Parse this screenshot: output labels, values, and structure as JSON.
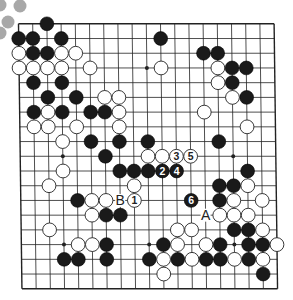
{
  "diagram": {
    "type": "go-board",
    "size": 19,
    "colors": {
      "background": "#ffffff",
      "line": "#222222",
      "black_stone": "#1a1a1a",
      "white_stone": "#ffffff",
      "decor_circle": "#a8a8a8"
    },
    "decor_circles": [
      {
        "x": 0,
        "y": 5
      },
      {
        "x": 20,
        "y": 6
      },
      {
        "x": 8,
        "y": 22
      },
      {
        "x": 0,
        "y": 33
      }
    ],
    "star_points": [
      [
        3,
        3
      ],
      [
        3,
        9
      ],
      [
        3,
        15
      ],
      [
        9,
        3
      ],
      [
        9,
        9
      ],
      [
        9,
        15
      ],
      [
        15,
        3
      ],
      [
        15,
        9
      ],
      [
        15,
        15
      ]
    ],
    "black_stones": [
      [
        0,
        2
      ],
      [
        1,
        0
      ],
      [
        1,
        1
      ],
      [
        1,
        3
      ],
      [
        1,
        10
      ],
      [
        2,
        1
      ],
      [
        2,
        2
      ],
      [
        2,
        13
      ],
      [
        2,
        14
      ],
      [
        3,
        15
      ],
      [
        3,
        16
      ],
      [
        4,
        1
      ],
      [
        4,
        3
      ],
      [
        4,
        15
      ],
      [
        5,
        2
      ],
      [
        5,
        4
      ],
      [
        5,
        16
      ],
      [
        6,
        1
      ],
      [
        6,
        3
      ],
      [
        6,
        5
      ],
      [
        6,
        6
      ],
      [
        8,
        5
      ],
      [
        8,
        7
      ],
      [
        8,
        9
      ],
      [
        8,
        14
      ],
      [
        9,
        6
      ],
      [
        10,
        7
      ],
      [
        10,
        8
      ],
      [
        10,
        9
      ],
      [
        10,
        16
      ],
      [
        11,
        14
      ],
      [
        11,
        15
      ],
      [
        12,
        4
      ],
      [
        12,
        14
      ],
      [
        13,
        6
      ],
      [
        13,
        7
      ],
      [
        14,
        15
      ],
      [
        14,
        16
      ],
      [
        15,
        6
      ],
      [
        15,
        10
      ],
      [
        15,
        14
      ],
      [
        15,
        16
      ],
      [
        15,
        17
      ],
      [
        16,
        3
      ],
      [
        16,
        4
      ],
      [
        16,
        6
      ],
      [
        16,
        9
      ],
      [
        16,
        11
      ],
      [
        16,
        13
      ],
      [
        16,
        14
      ],
      [
        16,
        16
      ],
      [
        17,
        17
      ]
    ],
    "white_stones": [
      [
        2,
        0
      ],
      [
        2,
        3
      ],
      [
        2,
        4
      ],
      [
        3,
        0
      ],
      [
        3,
        1
      ],
      [
        3,
        2
      ],
      [
        3,
        3
      ],
      [
        3,
        5
      ],
      [
        3,
        10
      ],
      [
        3,
        14
      ],
      [
        4,
        14
      ],
      [
        5,
        6
      ],
      [
        5,
        7
      ],
      [
        5,
        15
      ],
      [
        6,
        2
      ],
      [
        6,
        7
      ],
      [
        6,
        13
      ],
      [
        7,
        1
      ],
      [
        7,
        2
      ],
      [
        7,
        4
      ],
      [
        7,
        7
      ],
      [
        7,
        16
      ],
      [
        8,
        3
      ],
      [
        9,
        9
      ],
      [
        9,
        10
      ],
      [
        10,
        3
      ],
      [
        11,
        2
      ],
      [
        11,
        8
      ],
      [
        11,
        16
      ],
      [
        12,
        5
      ],
      [
        12,
        6
      ],
      [
        12,
        15
      ],
      [
        12,
        17
      ],
      [
        13,
        5
      ],
      [
        13,
        14
      ],
      [
        13,
        15
      ],
      [
        13,
        16
      ],
      [
        14,
        2
      ],
      [
        14,
        11
      ],
      [
        14,
        12
      ],
      [
        14,
        17
      ],
      [
        15,
        4
      ],
      [
        15,
        5
      ],
      [
        15,
        11
      ],
      [
        15,
        13
      ],
      [
        15,
        18
      ],
      [
        16,
        10
      ],
      [
        16,
        12
      ],
      [
        16,
        15
      ],
      [
        16,
        17
      ],
      [
        17,
        10
      ]
    ],
    "numbered_moves": [
      {
        "number": "1",
        "color": "white",
        "row": 12,
        "col": 8
      },
      {
        "number": "2",
        "color": "black",
        "row": 10,
        "col": 10
      },
      {
        "number": "3",
        "color": "white",
        "row": 9,
        "col": 11
      },
      {
        "number": "4",
        "color": "black",
        "row": 10,
        "col": 11
      },
      {
        "number": "5",
        "color": "white",
        "row": 9,
        "col": 12
      },
      {
        "number": "6",
        "color": "black",
        "row": 12,
        "col": 12
      }
    ],
    "letter_labels": [
      {
        "text": "B",
        "row": 12,
        "col": 7
      },
      {
        "text": "A",
        "row": 13,
        "col": 13
      }
    ]
  }
}
